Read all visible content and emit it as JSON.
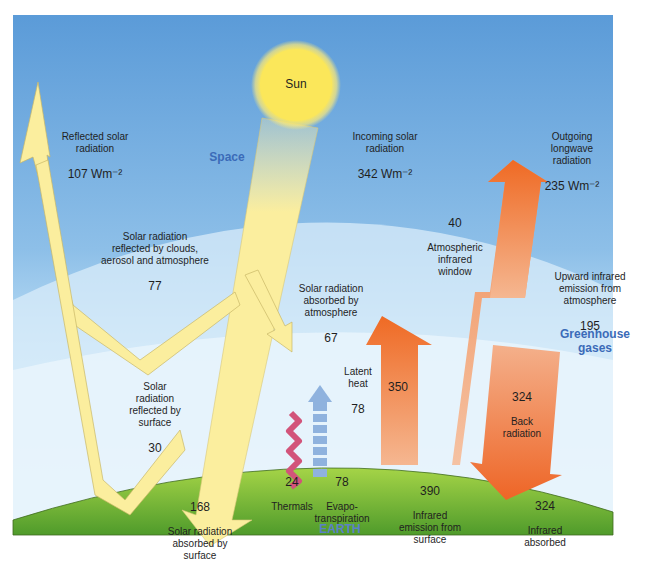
{
  "diagram": {
    "regions": {
      "space": "Space",
      "greenhouse": "Greenhouse\ngases",
      "earth": "EARTH"
    },
    "sun_label": "Sun",
    "colors": {
      "sky_top": "#5b9bd8",
      "sky_mid": "#a9cfee",
      "atmosphere_band": "#dceefa",
      "ground_top": "#9bcf3f",
      "ground_bottom": "#4e9a2a",
      "sun": "#fbe85a",
      "solar_arrow": "#fbeea0",
      "ir_arrow_dark": "#ef6f2a",
      "ir_arrow_light": "#f6b893",
      "thermals": "#d2547a",
      "evapo": "#8fb2de"
    },
    "flows": [
      {
        "id": "incoming_solar",
        "label": "Incoming solar\nradiation",
        "value": "342 Wm⁻²"
      },
      {
        "id": "reflected_solar",
        "label": "Reflected solar\nradiation",
        "value": "107 Wm⁻²"
      },
      {
        "id": "outgoing_longwave",
        "label": "Outgoing\nlongwave\nradiation",
        "value": "235 Wm⁻²"
      },
      {
        "id": "reflected_clouds",
        "label": "Solar radiation\nreflected by clouds,\naerosol and atmosphere",
        "value": "77"
      },
      {
        "id": "absorbed_atmosphere",
        "label": "Solar radiation\nabsorbed by\natmosphere",
        "value": "67"
      },
      {
        "id": "atm_window",
        "value": "40",
        "label": "Atmospheric\ninfrared\nwindow"
      },
      {
        "id": "upward_ir_atm",
        "label": "Upward infrared\nemission from\natmosphere",
        "value": "195"
      },
      {
        "id": "reflected_surface",
        "label": "Solar\nradiation\nreflected by\nsurface",
        "value": "30"
      },
      {
        "id": "latent_heat",
        "label": "Latent\nheat",
        "value": "78"
      },
      {
        "id": "ir_350",
        "value": "350"
      },
      {
        "id": "back_radiation",
        "value": "324",
        "label": "Back\nradiation"
      },
      {
        "id": "thermals",
        "value": "24",
        "label": "Thermals"
      },
      {
        "id": "evapotranspiration",
        "value": "78",
        "label": "Evapo-\ntranspiration"
      },
      {
        "id": "ir_surface",
        "value": "390",
        "label": "Infrared\nemission from\nsurface"
      },
      {
        "id": "ir_absorbed",
        "value": "324",
        "label": "Infrared\nabsorbed"
      },
      {
        "id": "absorbed_surface",
        "value": "168",
        "label": "Solar  radiation\nabsorbed by\nsurface"
      }
    ]
  }
}
